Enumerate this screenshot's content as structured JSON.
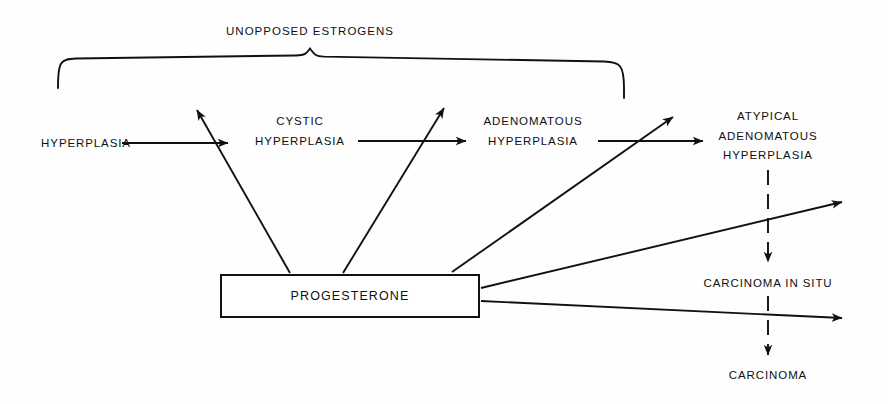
{
  "figure": {
    "type": "flow-diagram",
    "background_color": "#fefefe",
    "line_color": "#111111",
    "text_color": "#101010"
  },
  "brace": {
    "label": "UNOPPOSED ESTROGENS",
    "spans_nodes": [
      "HYPERPLASIA",
      "CYSTIC HYPERPLASIA",
      "ADENOMATOUS HYPERPLASIA",
      "ATYPICAL ADENOMATOUS HYPERPLASIA"
    ],
    "x_start": 58,
    "x_end": 625,
    "apex_x": 310
  },
  "progression": {
    "nodes": [
      {
        "id": "hyperplasia",
        "lines": [
          "HYPERPLASIA"
        ],
        "cx": 86,
        "cy": 143
      },
      {
        "id": "cystic-hyperplasia",
        "lines": [
          "CYSTIC",
          "HYPERPLASIA"
        ],
        "cx": 300,
        "cy": 131
      },
      {
        "id": "adenomatous-hyperplasia",
        "lines": [
          "ADENOMATOUS",
          "HYPERPLASIA"
        ],
        "cx": 533,
        "cy": 131
      },
      {
        "id": "atypical-adenomatous-hyperplasia",
        "lines": [
          "ATYPICAL",
          "ADENOMATOUS",
          "HYPERPLASIA"
        ],
        "cx": 768,
        "cy": 137
      }
    ]
  },
  "outcome_chain": {
    "style": "dashed",
    "nodes": [
      {
        "id": "carcinoma-in-situ",
        "lines": [
          "CARCINOMA IN SITU"
        ],
        "cx": 768,
        "cy": 283
      },
      {
        "id": "carcinoma",
        "lines": [
          "CARCINOMA"
        ],
        "cx": 768,
        "cy": 375
      }
    ]
  },
  "inhibitor": {
    "label": "PROGESTERONE",
    "box": {
      "x": 220,
      "y": 274,
      "width": 260,
      "height": 44
    },
    "inhibition_targets": [
      "hyperplasia-to-cystic-arrow",
      "cystic-to-adenomatous-arrow",
      "adenomatous-to-atypical-arrow",
      "atypical-to-carcinoma-in-situ-arrow",
      "carcinoma-in-situ-to-carcinoma-arrow"
    ]
  }
}
